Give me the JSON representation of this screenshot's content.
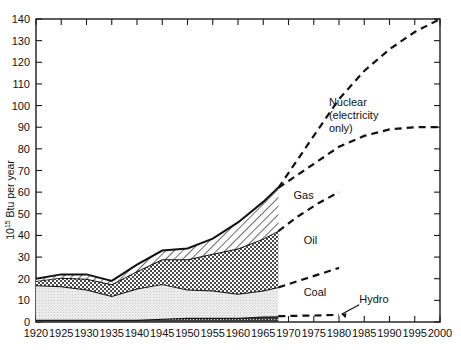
{
  "chart_data": {
    "type": "area",
    "title": "",
    "subtitle": "",
    "xlabel": "",
    "ylabel": "10¹⁵ Btu per year",
    "ylabel_main": "Btu per year",
    "ylabel_exponent": "15",
    "ylabel_mantissa": "10",
    "xlim": [
      1920,
      2000
    ],
    "ylim": [
      0,
      140
    ],
    "x_ticks": [
      1920,
      1925,
      1930,
      1935,
      1940,
      1945,
      1950,
      1955,
      1960,
      1965,
      1970,
      1975,
      1980,
      1985,
      1990,
      1995,
      2000
    ],
    "y_ticks": [
      0,
      10,
      20,
      30,
      40,
      50,
      60,
      70,
      80,
      90,
      100,
      110,
      120,
      130,
      140
    ],
    "grid": false,
    "legend_position": "inline-annotations",
    "stacked": true,
    "history_end_year": 1968,
    "x": [
      1920,
      1925,
      1930,
      1935,
      1940,
      1945,
      1950,
      1955,
      1960,
      1965,
      1968
    ],
    "series": [
      {
        "name": "Hydro",
        "fill": "solid-dark",
        "values": [
          1,
          1,
          1,
          1,
          1,
          1.5,
          2,
          2,
          2,
          2.5,
          2.7
        ]
      },
      {
        "name": "Coal",
        "fill": "light-gray",
        "values": [
          16,
          15.5,
          14,
          11,
          14.5,
          16,
          13,
          12.5,
          11,
          12,
          13.5
        ]
      },
      {
        "name": "Oil",
        "fill": "cross-hatch",
        "values": [
          2,
          4,
          5,
          5.5,
          8,
          11.5,
          14,
          17,
          21,
          24,
          26
        ]
      },
      {
        "name": "Gas",
        "fill": "diagonal-hatch",
        "values": [
          1,
          1.5,
          2,
          1.5,
          3,
          4,
          5,
          7,
          12,
          17,
          20
        ]
      }
    ],
    "annotations": [
      {
        "label": "Nuclear\n(electricity\nonly)",
        "lines": [
          "Nuclear",
          "(electricity",
          "only)"
        ],
        "x": 1978,
        "y": 100
      },
      {
        "label": "Gas",
        "x": 1971,
        "y": 57
      },
      {
        "label": "Oil",
        "x": 1973,
        "y": 36
      },
      {
        "label": "Coal",
        "x": 1973,
        "y": 12
      },
      {
        "label": "Hydro",
        "x": 1984,
        "y": 9
      }
    ],
    "projections": [
      {
        "name": "Total with nuclear",
        "style": "dashed",
        "points": [
          [
            1968,
            62
          ],
          [
            1975,
            86
          ],
          [
            1980,
            103
          ],
          [
            1985,
            116
          ],
          [
            1990,
            126
          ],
          [
            1995,
            134
          ],
          [
            2000,
            140
          ]
        ]
      },
      {
        "name": "Total without nuclear",
        "style": "dashed",
        "points": [
          [
            1968,
            62
          ],
          [
            1975,
            73
          ],
          [
            1980,
            81
          ],
          [
            1985,
            86
          ],
          [
            1990,
            89
          ],
          [
            1995,
            90
          ],
          [
            2000,
            90
          ]
        ]
      },
      {
        "name": "Gas",
        "style": "dashed",
        "points": [
          [
            1968,
            42
          ],
          [
            1972,
            49
          ],
          [
            1976,
            55
          ],
          [
            1980,
            60
          ]
        ]
      },
      {
        "name": "Oil",
        "style": "dashed",
        "points": [
          [
            1968,
            16
          ],
          [
            1972,
            19
          ],
          [
            1976,
            22
          ],
          [
            1980,
            25
          ]
        ]
      },
      {
        "name": "Hydro",
        "style": "dashed",
        "points": [
          [
            1968,
            2.7
          ],
          [
            1975,
            3
          ],
          [
            1980,
            3.3
          ]
        ]
      }
    ],
    "hydro_arrow": {
      "from": [
        1984,
        8
      ],
      "to": [
        1980.5,
        3.6
      ]
    }
  }
}
